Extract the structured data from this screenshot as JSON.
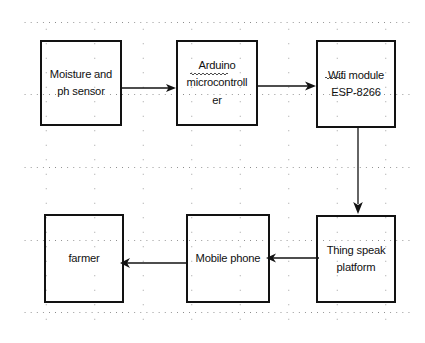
{
  "diagram": {
    "background_color": "#ffffff",
    "stroke_color": "#121212",
    "grid_dot_color": "#8a8a8a",
    "nodes": [
      {
        "id": "sensor",
        "label": "Moisture and\nph sensor",
        "row": "top",
        "order": 1
      },
      {
        "id": "arduino",
        "label": "Arduino\nmicrocontroll\ner",
        "row": "top",
        "order": 2
      },
      {
        "id": "wifi",
        "label": "Wifi module\nESP-8266",
        "row": "top",
        "order": 3
      },
      {
        "id": "thingspeak",
        "label": "Thing speak\nplatform",
        "row": "bottom",
        "order": 1
      },
      {
        "id": "mobile",
        "label": "Mobile phone",
        "row": "bottom",
        "order": 2
      },
      {
        "id": "farmer",
        "label": "farmer",
        "row": "bottom",
        "order": 3
      }
    ],
    "edges": [
      {
        "id": "sensor-to-arduino",
        "from": "sensor",
        "to": "arduino",
        "direction": "right"
      },
      {
        "id": "arduino-to-wifi",
        "from": "arduino",
        "to": "wifi",
        "direction": "right"
      },
      {
        "id": "wifi-to-thingspeak",
        "from": "wifi",
        "to": "thingspeak",
        "direction": "down"
      },
      {
        "id": "thingspeak-to-mobile",
        "from": "thingspeak",
        "to": "mobile",
        "direction": "left"
      },
      {
        "id": "mobile-to-farmer",
        "from": "mobile",
        "to": "farmer",
        "direction": "left"
      }
    ],
    "annotations": [
      {
        "id": "squiggle-arduino",
        "target": "arduino",
        "word": "Arduino"
      },
      {
        "id": "squiggle-wifi",
        "target": "wifi",
        "word": "Wifi"
      }
    ]
  }
}
